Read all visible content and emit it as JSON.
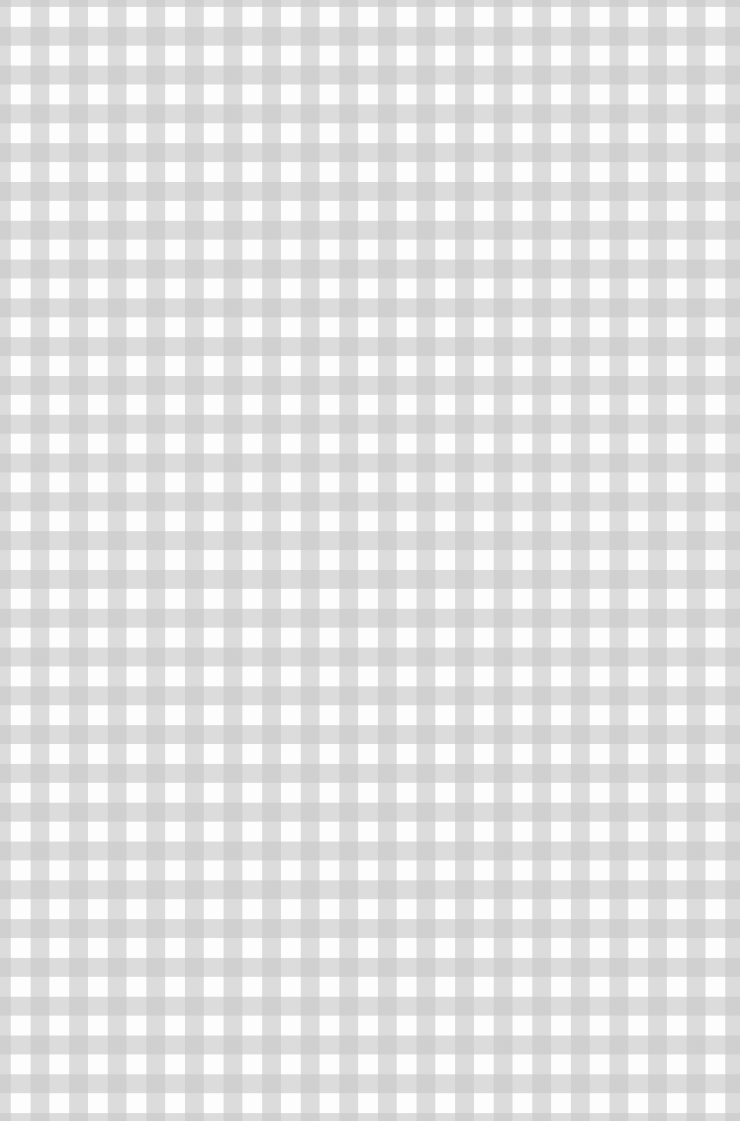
{
  "image": {
    "subject": "gingham check fabric pattern",
    "colors": {
      "square": "#fdfdfd",
      "stripe": "#dedede",
      "intersection": "#cfcfcf"
    },
    "pattern": {
      "pitch_x_px": 38.6,
      "pitch_y_px": 38.8,
      "stripe_width_px": 19
    }
  }
}
